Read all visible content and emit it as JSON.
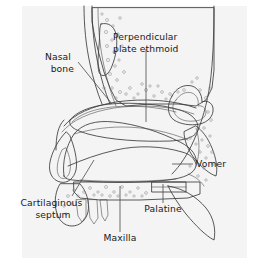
{
  "figure": {
    "type": "anatomical-illustration",
    "background_color": "#ffffff",
    "panel_color": "#f4f4f4",
    "line_color": "#3b3b3b",
    "text_color": "#1a1a1a"
  },
  "shading": {
    "bone_fill": "#efefef",
    "ethmoid_fill": "#cfcfcf",
    "septum_fill": "#a8a8a8",
    "cavity_fill": "#ffffff",
    "palatine_fill": "#f2f2f2"
  },
  "labels": [
    {
      "id": "perpendicular-plate-ethmoid",
      "lines": [
        "Perpendicular",
        "plate ethmoid"
      ],
      "align": "start",
      "x": 113,
      "y": 40,
      "line_height": 11.5
    },
    {
      "id": "nasal-bone",
      "lines": [
        "Nasal",
        "bone"
      ],
      "align": "end",
      "x": 74,
      "y": 60,
      "line_height": 11.5
    },
    {
      "id": "vomer",
      "lines": [
        "Vomer"
      ],
      "align": "start",
      "x": 196,
      "y": 167,
      "line_height": 11.5
    },
    {
      "id": "cartilaginous-septum",
      "lines": [
        "Cartilaginous",
        "septum"
      ],
      "align": "middle",
      "x": 53,
      "y": 206,
      "line_height": 11.5
    },
    {
      "id": "palatine",
      "lines": [
        "Palatine"
      ],
      "align": "middle",
      "x": 163,
      "y": 212,
      "line_height": 11.5
    },
    {
      "id": "maxilla",
      "lines": [
        "Maxilla"
      ],
      "align": "middle",
      "x": 120,
      "y": 241,
      "line_height": 11.5
    }
  ],
  "structures": [
    {
      "id": "frontal-sinus",
      "name": "frontal sinus"
    },
    {
      "id": "nasal-bone-shaft",
      "name": "nasal bone"
    },
    {
      "id": "perpendicular-plate",
      "name": "perpendicular plate of ethmoid"
    },
    {
      "id": "vomer-bone",
      "name": "vomer"
    },
    {
      "id": "cartilaginous-septum-plate",
      "name": "septal cartilage"
    },
    {
      "id": "sphenoid-sinus",
      "name": "sphenoid sinus"
    },
    {
      "id": "hard-palate",
      "name": "hard palate"
    },
    {
      "id": "palatine-bone",
      "name": "palatine bone"
    },
    {
      "id": "maxilla-bone",
      "name": "maxilla"
    },
    {
      "id": "nasal-tip",
      "name": "nasal tip and columella"
    },
    {
      "id": "incisor-teeth",
      "name": "incisor teeth"
    }
  ]
}
